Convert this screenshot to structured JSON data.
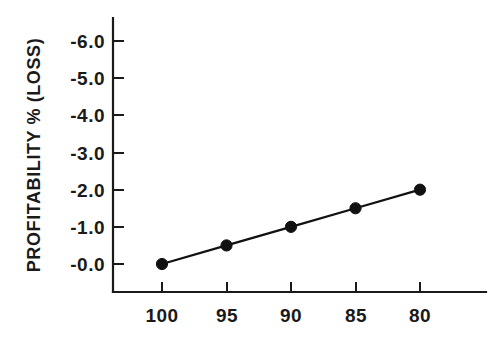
{
  "chart_data": {
    "type": "line",
    "title": "",
    "xlabel": "",
    "ylabel": "PROFITABILITY % (LOSS)",
    "x": [
      100,
      95,
      90,
      85,
      80
    ],
    "values": [
      -0.0,
      -0.5,
      -1.0,
      -1.5,
      -2.0
    ],
    "series": [
      {
        "name": "",
        "values": [
          -0.0,
          -0.5,
          -1.0,
          -1.5,
          -2.0
        ]
      }
    ],
    "xticklabels": [
      "100",
      "95",
      "90",
      "85",
      "80"
    ],
    "yticklabels": [
      "-0.0",
      "-1.0",
      "-2.0",
      "-3.0",
      "-4.0",
      "-5.0",
      "-6.0"
    ],
    "yticks": [
      -0.0,
      -1.0,
      -2.0,
      -3.0,
      -4.0,
      -5.0,
      -6.0
    ],
    "xlim": [
      100,
      80
    ],
    "ylim": [
      -0.0,
      -6.0
    ],
    "x_axis_inverted": true,
    "grid": false,
    "legend": null,
    "marker": "filled-circle",
    "line_color": "#111111",
    "marker_color": "#111111",
    "background_color": "#ffffff",
    "annotations": []
  },
  "axes": {
    "y_title": "PROFITABILITY % (LOSS)",
    "x_title": ""
  }
}
